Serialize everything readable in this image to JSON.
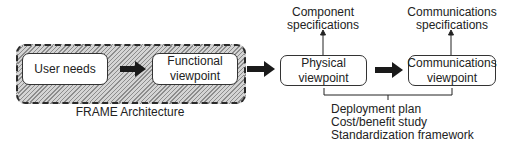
{
  "diagram": {
    "group": {
      "label": "FRAME Architecture",
      "style": "dashed border, hatched fill"
    },
    "nodes": [
      {
        "id": "user-needs",
        "line1": "User needs",
        "line2": ""
      },
      {
        "id": "functional",
        "line1": "Functional",
        "line2": "viewpoint"
      },
      {
        "id": "physical",
        "line1": "Physical",
        "line2": "viewpoint"
      },
      {
        "id": "communications",
        "line1": "Communications",
        "line2": "viewpoint"
      }
    ],
    "outputs": {
      "physical": {
        "line1": "Component",
        "line2": "specifications"
      },
      "communications": {
        "line1": "Communications",
        "line2": "specifications"
      }
    },
    "bracket_outputs": [
      "Deployment plan",
      "Cost/benefit study",
      "Standardization framework"
    ],
    "edges": [
      {
        "from": "user-needs",
        "to": "functional",
        "type": "thick-arrow"
      },
      {
        "from": "functional",
        "to": "physical",
        "type": "thick-arrow"
      },
      {
        "from": "physical",
        "to": "communications",
        "type": "thick-arrow"
      },
      {
        "from": "physical",
        "to": "component-specifications",
        "type": "thin-arrow"
      },
      {
        "from": "communications",
        "to": "communications-specifications",
        "type": "thin-arrow"
      }
    ],
    "colors": {
      "stroke": "#222222",
      "hatch_dark": "#8c8c8c",
      "hatch_light": "#d4d4d4",
      "box_fill": "#ffffff"
    }
  }
}
